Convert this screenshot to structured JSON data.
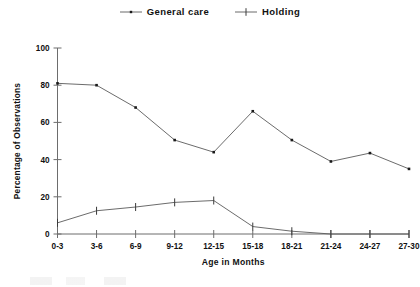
{
  "chart_data": {
    "type": "line",
    "title": "",
    "xlabel": "Age in Months",
    "ylabel": "Percentage of Observations",
    "categories": [
      "0-3",
      "3-6",
      "6-9",
      "9-12",
      "12-15",
      "15-18",
      "18-21",
      "21-24",
      "24-27",
      "27-30"
    ],
    "ylim": [
      0,
      100
    ],
    "yticks": [
      0,
      20,
      40,
      60,
      80,
      100
    ],
    "grid": false,
    "legend_position": "top-center",
    "series": [
      {
        "name": "General care",
        "marker": "dot",
        "color": "#5a5a5a",
        "values": [
          81,
          80,
          68,
          50.5,
          44,
          66,
          50.5,
          39,
          43.5,
          35
        ]
      },
      {
        "name": "Holding",
        "marker": "cross",
        "color": "#5a5a5a",
        "values": [
          6,
          12.5,
          14.5,
          17,
          18,
          4,
          1.5,
          0,
          0,
          0
        ]
      }
    ]
  },
  "legend": {
    "entries": [
      {
        "label": "General care",
        "marker": "dot-marker-icon"
      },
      {
        "label": "Holding",
        "marker": "cross-marker-icon"
      }
    ]
  },
  "axes": {
    "y_title": "Percentage of Observations",
    "x_title": "Age in Months",
    "y_tick_labels": [
      "100",
      "80",
      "60",
      "40",
      "20",
      "0"
    ],
    "x_tick_labels": [
      "0-3",
      "3-6",
      "6-9",
      "9-12",
      "12-15",
      "15-18",
      "18-21",
      "21-24",
      "24-27",
      "27-30"
    ]
  }
}
